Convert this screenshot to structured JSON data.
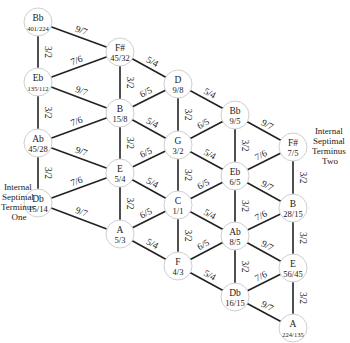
{
  "diagram": {
    "type": "tonnetz-lattice",
    "nodes": [
      {
        "id": "n0",
        "note": "Bb",
        "ratio": "401/224",
        "x": 38,
        "y": 22,
        "small": true
      },
      {
        "id": "n1",
        "note": "F#",
        "ratio": "45/32",
        "x": 120,
        "y": 52
      },
      {
        "id": "n2",
        "note": "D",
        "ratio": "9/8",
        "x": 178,
        "y": 84
      },
      {
        "id": "n3",
        "note": "Bb",
        "ratio": "9/5",
        "x": 235,
        "y": 115
      },
      {
        "id": "n4",
        "note": "F#",
        "ratio": "7/5",
        "x": 293,
        "y": 147
      },
      {
        "id": "n5",
        "note": "Eb",
        "ratio": "135/112",
        "x": 38,
        "y": 82,
        "small": true
      },
      {
        "id": "n6",
        "note": "B",
        "ratio": "15/8",
        "x": 120,
        "y": 113
      },
      {
        "id": "n7",
        "note": "G",
        "ratio": "3/2",
        "x": 178,
        "y": 145
      },
      {
        "id": "n8",
        "note": "Eb",
        "ratio": "6/5",
        "x": 235,
        "y": 176
      },
      {
        "id": "n9",
        "note": "B",
        "ratio": "28/15",
        "x": 293,
        "y": 208
      },
      {
        "id": "n10",
        "note": "Ab",
        "ratio": "45/28",
        "x": 38,
        "y": 143
      },
      {
        "id": "n11",
        "note": "E",
        "ratio": "5/4",
        "x": 120,
        "y": 173
      },
      {
        "id": "n12",
        "note": "C",
        "ratio": "1/1",
        "x": 178,
        "y": 205
      },
      {
        "id": "n13",
        "note": "Ab",
        "ratio": "8/5",
        "x": 235,
        "y": 236
      },
      {
        "id": "n14",
        "note": "E",
        "ratio": "56/45",
        "x": 293,
        "y": 268
      },
      {
        "id": "n15",
        "note": "Db",
        "ratio": "15/14",
        "x": 38,
        "y": 203
      },
      {
        "id": "n16",
        "note": "A",
        "ratio": "5/3",
        "x": 120,
        "y": 234
      },
      {
        "id": "n17",
        "note": "F",
        "ratio": "4/3",
        "x": 178,
        "y": 266
      },
      {
        "id": "n18",
        "note": "Db",
        "ratio": "16/15",
        "x": 235,
        "y": 297
      },
      {
        "id": "n19",
        "note": "A",
        "ratio": "224/135",
        "x": 293,
        "y": 328,
        "small": true
      }
    ],
    "edges": [
      {
        "from": "n0",
        "to": "n1",
        "label": "9/7"
      },
      {
        "from": "n1",
        "to": "n2",
        "label": "5/4"
      },
      {
        "from": "n2",
        "to": "n3",
        "label": "5/4"
      },
      {
        "from": "n3",
        "to": "n4",
        "label": "9/7"
      },
      {
        "from": "n5",
        "to": "n6",
        "label": "9/7"
      },
      {
        "from": "n6",
        "to": "n7",
        "label": "5/4"
      },
      {
        "from": "n7",
        "to": "n8",
        "label": "5/4"
      },
      {
        "from": "n8",
        "to": "n9",
        "label": "9/7"
      },
      {
        "from": "n10",
        "to": "n11",
        "label": "9/7"
      },
      {
        "from": "n11",
        "to": "n12",
        "label": "5/4"
      },
      {
        "from": "n12",
        "to": "n13",
        "label": "5/4"
      },
      {
        "from": "n13",
        "to": "n14",
        "label": "9/7"
      },
      {
        "from": "n15",
        "to": "n16",
        "label": "9/7"
      },
      {
        "from": "n16",
        "to": "n17",
        "label": "5/4"
      },
      {
        "from": "n17",
        "to": "n18",
        "label": "5/4"
      },
      {
        "from": "n18",
        "to": "n19",
        "label": "9/7"
      },
      {
        "from": "n5",
        "to": "n1",
        "label": "7/6"
      },
      {
        "from": "n6",
        "to": "n2",
        "label": "6/5"
      },
      {
        "from": "n7",
        "to": "n3",
        "label": "6/5"
      },
      {
        "from": "n8",
        "to": "n4",
        "label": "7/6"
      },
      {
        "from": "n10",
        "to": "n6",
        "label": "7/6"
      },
      {
        "from": "n11",
        "to": "n7",
        "label": "6/5"
      },
      {
        "from": "n12",
        "to": "n8",
        "label": "6/5"
      },
      {
        "from": "n13",
        "to": "n9",
        "label": "7/6"
      },
      {
        "from": "n15",
        "to": "n11",
        "label": "7/6"
      },
      {
        "from": "n16",
        "to": "n12",
        "label": "6/5"
      },
      {
        "from": "n17",
        "to": "n13",
        "label": "6/5"
      },
      {
        "from": "n18",
        "to": "n14",
        "label": "7/6"
      },
      {
        "from": "n0",
        "to": "n5",
        "label": "3/2"
      },
      {
        "from": "n5",
        "to": "n10",
        "label": "3/2"
      },
      {
        "from": "n10",
        "to": "n15",
        "label": "3/2"
      },
      {
        "from": "n1",
        "to": "n6",
        "label": "3/2"
      },
      {
        "from": "n6",
        "to": "n11",
        "label": "3/2"
      },
      {
        "from": "n11",
        "to": "n16",
        "label": "3/2"
      },
      {
        "from": "n2",
        "to": "n7",
        "label": "3/2"
      },
      {
        "from": "n7",
        "to": "n12",
        "label": "3/2"
      },
      {
        "from": "n12",
        "to": "n17",
        "label": "3/2"
      },
      {
        "from": "n3",
        "to": "n8",
        "label": "3/2"
      },
      {
        "from": "n8",
        "to": "n13",
        "label": "3/2"
      },
      {
        "from": "n13",
        "to": "n18",
        "label": "3/2"
      },
      {
        "from": "n4",
        "to": "n9",
        "label": "3/2"
      },
      {
        "from": "n9",
        "to": "n14",
        "label": "3/2"
      },
      {
        "from": "n14",
        "to": "n19",
        "label": "3/2"
      }
    ],
    "annotations": {
      "left": [
        "Internal",
        "Septimal",
        "Terminus",
        "One"
      ],
      "right": [
        "Internal",
        "Septimal",
        "Terminus",
        "Two"
      ]
    }
  }
}
